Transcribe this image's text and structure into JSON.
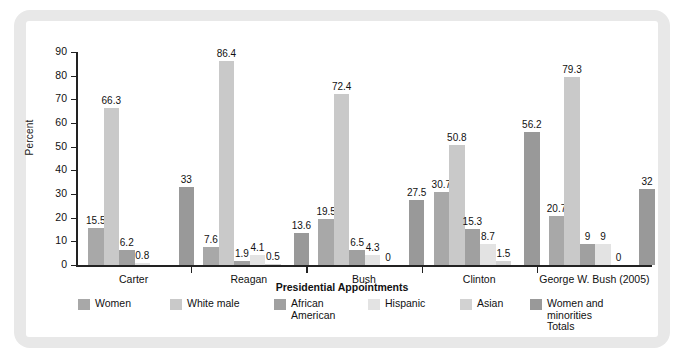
{
  "chart_data": {
    "type": "bar",
    "title": "",
    "subtitle": "",
    "xlabel": "Presidential Appointments",
    "ylabel": "Percent",
    "ylim": [
      0,
      90
    ],
    "ytick_labels": [
      "0",
      "10",
      "20",
      "30",
      "40",
      "50",
      "60",
      "70",
      "80",
      "90"
    ],
    "grid": false,
    "legend_position": "bottom",
    "categories": [
      "Carter",
      "Reagan",
      "Bush",
      "Clinton",
      "George W. Bush (2005)"
    ],
    "series": [
      {
        "name": "Women",
        "color": "#a8a8a8",
        "values": [
          15.5,
          7.6,
          19.5,
          30.7,
          20.7
        ],
        "labels": [
          "15.5",
          "7.6",
          "19.5",
          "30.7",
          "20.7"
        ]
      },
      {
        "name": "White male",
        "color": "#c9c9c9",
        "values": [
          66.3,
          86.4,
          72.4,
          50.8,
          79.3
        ],
        "labels": [
          "66.3",
          "86.4",
          "72.4",
          "50.8",
          "79.3"
        ]
      },
      {
        "name": "African\nAmerican",
        "color": "#a0a0a0",
        "values": [
          6.2,
          1.9,
          6.5,
          15.3,
          9
        ],
        "labels": [
          "6.2",
          "1.9",
          "6.5",
          "15.3",
          "9"
        ]
      },
      {
        "name": "Hispanic",
        "color": "#e3e3e3",
        "values": [
          0.8,
          4.1,
          4.3,
          8.7,
          9
        ],
        "labels": [
          "0.8",
          "4.1",
          "4.3",
          "8.7",
          "9"
        ]
      },
      {
        "name": "Asian",
        "color": "#d2d2d2",
        "values": [
          0,
          0.5,
          0,
          1.5,
          0
        ],
        "labels": [
          "",
          "0.5",
          "0",
          "1.5",
          "0"
        ]
      },
      {
        "name": "Women and minorities\nTotals",
        "color": "#999999",
        "values": [
          33,
          13.6,
          27.5,
          56.2,
          32
        ],
        "labels": [
          "33",
          "13.6",
          "27.5",
          "56.2",
          "32"
        ]
      }
    ]
  },
  "legend": {
    "items": [
      {
        "label": "Women"
      },
      {
        "label": "White male"
      },
      {
        "label": "African\nAmerican"
      },
      {
        "label": "Hispanic"
      },
      {
        "label": "Asian"
      },
      {
        "label": "Women and minorities\nTotals"
      }
    ]
  }
}
